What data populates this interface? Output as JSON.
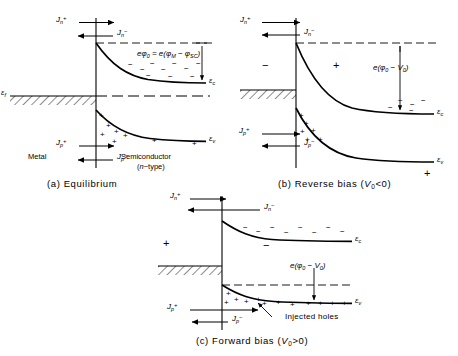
{
  "figure": {
    "ink_color": "#000000",
    "background_color": "#ffffff"
  },
  "symbols": {
    "e_c": "ε",
    "e_c_sub": "c",
    "e_v": "ε",
    "e_v_sub": "v",
    "e_f": "ε",
    "e_f_sub": "f",
    "minus": "−",
    "plus": "+"
  },
  "panels": [
    {
      "id": "a",
      "caption": "(a)  Equilibrium",
      "caption_label": "(a)",
      "caption_text": "Equilibrium",
      "region_left_label": "Metal",
      "region_right_label_line1": "Semiconductor",
      "region_right_label_line2": "(n−type)",
      "band_labels": {
        "conduction": "ε",
        "conduction_sub": "c",
        "valence": "ε",
        "valence_sub": "v",
        "fermi": "ε",
        "fermi_sub": "f"
      },
      "currents": [
        {
          "name": "Jn_plus",
          "symbol": "J",
          "sub": "n",
          "sup": "+",
          "direction": "right"
        },
        {
          "name": "Jn_minus",
          "symbol": "J",
          "sub": "n",
          "sup": "−",
          "direction": "left"
        },
        {
          "name": "Jp_plus",
          "symbol": "J",
          "sub": "p",
          "sup": "+",
          "direction": "right"
        },
        {
          "name": "Jp_minus",
          "symbol": "J",
          "sub": "p",
          "sup": "−",
          "direction": "left"
        }
      ],
      "barrier_equation": "eφ₀ = e(φM − φSC)",
      "barrier_equation_parts": {
        "lhs_e": "e",
        "lhs_phi": "φ",
        "lhs_sub": "0",
        "equals": "=",
        "rhs_e": "e",
        "open": "(",
        "phi_m": "φ",
        "phi_m_sub": "M",
        "dash": "−",
        "phi_sc": "φ",
        "phi_sc_sub": "SC",
        "close": ")"
      }
    },
    {
      "id": "b",
      "caption": "(b)  Reverse bias (V₀<0)",
      "caption_label": "(b)",
      "caption_text": "Reverse  bias",
      "caption_condition_open": "(",
      "caption_condition_v": "V",
      "caption_condition_sub": "0",
      "caption_condition_rel": "<0",
      "caption_condition_close": ")",
      "bias_signs": [
        {
          "name": "metal-side-sign",
          "value": "−"
        },
        {
          "name": "semiconductor-side-sign",
          "value": "+"
        }
      ],
      "barrier_equation_parts": {
        "e": "e",
        "open": "(",
        "phi": "φ",
        "phi_sub": "0",
        "dash": "−",
        "v": "V",
        "v_sub": "0",
        "close": ")"
      },
      "currents": [
        {
          "name": "Jn_plus",
          "symbol": "J",
          "sub": "n",
          "sup": "+",
          "direction": "right"
        },
        {
          "name": "Jn_minus",
          "symbol": "J",
          "sub": "n",
          "sup": "−",
          "direction": "left"
        },
        {
          "name": "Jp_plus",
          "symbol": "J",
          "sub": "p",
          "sup": "+",
          "direction": "right"
        },
        {
          "name": "Jp_minus",
          "symbol": "J",
          "sub": "p",
          "sup": "−",
          "direction": "left"
        }
      ],
      "band_labels": {
        "conduction": "ε",
        "conduction_sub": "c",
        "valence": "ε",
        "valence_sub": "v"
      }
    },
    {
      "id": "c",
      "caption": "(c)  Forward bias (V₀>0)",
      "caption_label": "(c)",
      "caption_text": "Forward  bias",
      "caption_condition_open": "(",
      "caption_condition_v": "V",
      "caption_condition_sub": "0",
      "caption_condition_rel": ">0",
      "caption_condition_close": ")",
      "bias_signs": [
        {
          "name": "metal-side-sign",
          "value": "+"
        },
        {
          "name": "semiconductor-side-sign",
          "value": "−"
        }
      ],
      "annotation": "Injected holes",
      "barrier_equation_parts": {
        "e": "e",
        "open": "(",
        "phi": "φ",
        "phi_sub": "0",
        "dash": "−",
        "v": "V",
        "v_sub": "0",
        "close": ")"
      },
      "currents": [
        {
          "name": "Jn_plus",
          "symbol": "J",
          "sub": "n",
          "sup": "+",
          "direction": "right"
        },
        {
          "name": "Jn_minus",
          "symbol": "J",
          "sub": "n",
          "sup": "−",
          "direction": "left"
        },
        {
          "name": "Jp_plus",
          "symbol": "J",
          "sub": "p",
          "sup": "+",
          "direction": "right"
        },
        {
          "name": "Jp_minus",
          "symbol": "J",
          "sub": "p",
          "sup": "−",
          "direction": "left"
        }
      ],
      "band_labels": {
        "conduction": "ε",
        "conduction_sub": "c",
        "valence": "ε",
        "valence_sub": "v"
      }
    }
  ]
}
